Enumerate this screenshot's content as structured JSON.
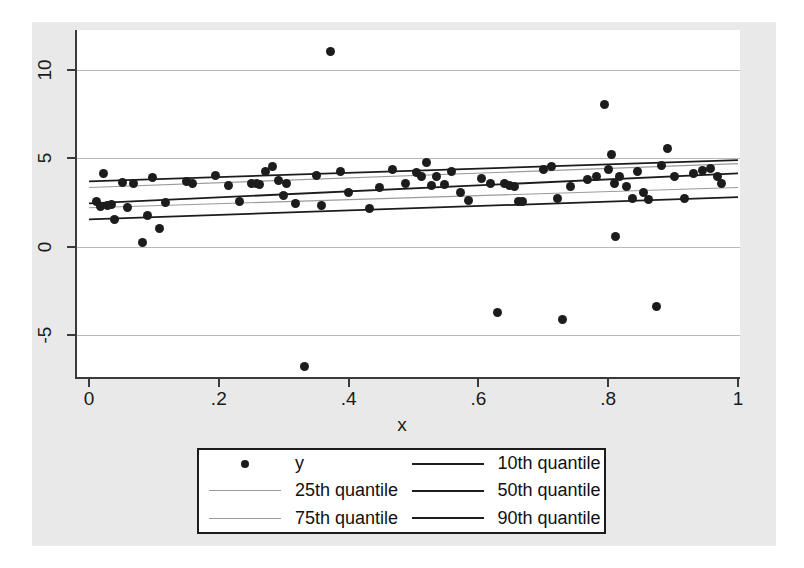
{
  "chart_data": {
    "type": "scatter",
    "title": "",
    "xlabel": "x",
    "ylabel": "",
    "xlim": [
      -0.02,
      1.0
    ],
    "ylim": [
      -7.8,
      11.8
    ],
    "grid": true,
    "legend_position": "bottom",
    "xticks": [
      "0",
      ".2",
      ".4",
      ".6",
      ".8",
      "1"
    ],
    "xtick_values": [
      0,
      0.2,
      0.4,
      0.6,
      0.8,
      1
    ],
    "yticks": [
      "-5",
      "0",
      "5",
      "10"
    ],
    "ytick_values": [
      -5,
      0,
      5,
      10
    ],
    "series": [
      {
        "name": "y",
        "type": "scatter",
        "marker": "filled-circle",
        "color": "#1c1c1c",
        "points": [
          [
            0.012,
            2.55
          ],
          [
            0.018,
            2.25
          ],
          [
            0.022,
            4.15
          ],
          [
            0.028,
            2.35
          ],
          [
            0.035,
            2.4
          ],
          [
            0.04,
            1.55
          ],
          [
            0.052,
            3.65
          ],
          [
            0.06,
            2.2
          ],
          [
            0.068,
            3.6
          ],
          [
            0.082,
            0.25
          ],
          [
            0.09,
            1.75
          ],
          [
            0.098,
            3.9
          ],
          [
            0.108,
            1.05
          ],
          [
            0.118,
            2.5
          ],
          [
            0.15,
            3.7
          ],
          [
            0.16,
            3.55
          ],
          [
            0.195,
            4.05
          ],
          [
            0.215,
            3.45
          ],
          [
            0.232,
            2.55
          ],
          [
            0.25,
            3.55
          ],
          [
            0.258,
            3.6
          ],
          [
            0.262,
            3.5
          ],
          [
            0.272,
            4.25
          ],
          [
            0.282,
            4.55
          ],
          [
            0.292,
            3.75
          ],
          [
            0.3,
            2.9
          ],
          [
            0.305,
            3.6
          ],
          [
            0.318,
            2.45
          ],
          [
            0.332,
            -6.8
          ],
          [
            0.35,
            4.05
          ],
          [
            0.358,
            2.35
          ],
          [
            0.372,
            11.05
          ],
          [
            0.388,
            4.25
          ],
          [
            0.4,
            3.05
          ],
          [
            0.432,
            2.15
          ],
          [
            0.448,
            3.35
          ],
          [
            0.468,
            4.35
          ],
          [
            0.488,
            3.6
          ],
          [
            0.505,
            4.2
          ],
          [
            0.512,
            3.95
          ],
          [
            0.52,
            4.75
          ],
          [
            0.528,
            3.45
          ],
          [
            0.535,
            4.0
          ],
          [
            0.548,
            3.5
          ],
          [
            0.558,
            4.25
          ],
          [
            0.572,
            3.05
          ],
          [
            0.585,
            2.6
          ],
          [
            0.605,
            3.85
          ],
          [
            0.618,
            3.6
          ],
          [
            0.63,
            -3.7
          ],
          [
            0.64,
            3.55
          ],
          [
            0.648,
            3.45
          ],
          [
            0.655,
            3.4
          ],
          [
            0.662,
            2.55
          ],
          [
            0.668,
            2.55
          ],
          [
            0.7,
            4.35
          ],
          [
            0.712,
            4.55
          ],
          [
            0.722,
            2.75
          ],
          [
            0.73,
            -4.15
          ],
          [
            0.742,
            3.4
          ],
          [
            0.768,
            3.8
          ],
          [
            0.782,
            4.0
          ],
          [
            0.795,
            8.05
          ],
          [
            0.8,
            4.35
          ],
          [
            0.805,
            5.2
          ],
          [
            0.81,
            3.55
          ],
          [
            0.812,
            0.55
          ],
          [
            0.818,
            4.0
          ],
          [
            0.828,
            3.4
          ],
          [
            0.838,
            2.7
          ],
          [
            0.845,
            4.25
          ],
          [
            0.855,
            3.05
          ],
          [
            0.862,
            2.65
          ],
          [
            0.875,
            -3.4
          ],
          [
            0.882,
            4.6
          ],
          [
            0.892,
            5.55
          ],
          [
            0.902,
            4.0
          ],
          [
            0.918,
            2.7
          ],
          [
            0.932,
            4.15
          ],
          [
            0.945,
            4.3
          ],
          [
            0.958,
            4.45
          ],
          [
            0.968,
            4.0
          ],
          [
            0.975,
            3.55
          ]
        ]
      },
      {
        "name": "10th quantile",
        "type": "line",
        "color": "#1c1c1c",
        "weight": "dark",
        "endpoints": [
          [
            0.0,
            1.55
          ],
          [
            1.0,
            2.8
          ]
        ]
      },
      {
        "name": "25th quantile",
        "type": "line",
        "color": "#9a9a9a",
        "weight": "light",
        "endpoints": [
          [
            0.0,
            2.2
          ],
          [
            1.0,
            3.35
          ]
        ]
      },
      {
        "name": "50th quantile",
        "type": "line",
        "color": "#1c1c1c",
        "weight": "dark",
        "endpoints": [
          [
            0.0,
            2.45
          ],
          [
            1.0,
            4.15
          ]
        ]
      },
      {
        "name": "75th quantile",
        "type": "line",
        "color": "#9a9a9a",
        "weight": "light",
        "endpoints": [
          [
            0.0,
            3.35
          ],
          [
            1.0,
            4.7
          ]
        ]
      },
      {
        "name": "90th quantile",
        "type": "line",
        "color": "#1c1c1c",
        "weight": "dark",
        "endpoints": [
          [
            0.0,
            3.7
          ],
          [
            1.0,
            4.9
          ]
        ]
      }
    ]
  },
  "axes": {
    "x_title": "x",
    "x_tick_labels": [
      "0",
      ".2",
      ".4",
      ".6",
      ".8",
      "1"
    ],
    "y_tick_labels": [
      "10",
      "5",
      "0",
      "-5"
    ]
  },
  "legend": {
    "items": [
      {
        "label": "y",
        "key": "marker"
      },
      {
        "label": "10th quantile",
        "key": "line-dark"
      },
      {
        "label": "25th quantile",
        "key": "line-light"
      },
      {
        "label": "50th quantile",
        "key": "line-dark"
      },
      {
        "label": "75th quantile",
        "key": "line-light"
      },
      {
        "label": "90th quantile",
        "key": "line-dark"
      }
    ]
  },
  "colors": {
    "marker": "#1c1c1c",
    "line_dark": "#1c1c1c",
    "line_light": "#9a9a9a",
    "grid": "#b9b9b9",
    "axis": "#3a3a3a",
    "plot_bg": "#ffffff",
    "graph_bg": "#e9e9e9"
  }
}
